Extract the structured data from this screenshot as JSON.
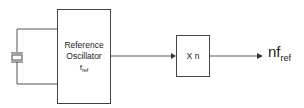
{
  "diagram": {
    "type": "block-diagram",
    "title": "",
    "blocks": [
      {
        "id": "reference-oscillator",
        "label_line1": "Reference",
        "label_line2": "Oscillator",
        "freq_symbol": "f",
        "freq_subscript": "ref"
      },
      {
        "id": "multiplier",
        "label": "X n"
      }
    ],
    "components": [
      {
        "id": "crystal",
        "symbol": "crystal-resonator"
      }
    ],
    "output": {
      "prefix": "nf",
      "subscript": "ref"
    },
    "connections": [
      {
        "from": "crystal",
        "to": "reference-oscillator"
      },
      {
        "from": "reference-oscillator",
        "to": "multiplier",
        "arrow": true
      },
      {
        "from": "multiplier",
        "to": "output",
        "arrow": true
      }
    ],
    "colors": {
      "line": "#444444",
      "text": "#222222",
      "background": "#ffffff"
    }
  }
}
